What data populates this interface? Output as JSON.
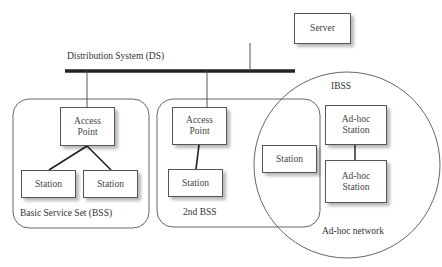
{
  "diagram": {
    "distribution_system": {
      "label": "Distribution System (DS)"
    },
    "server": {
      "label": "Server"
    },
    "bss1": {
      "label": "Basic Service Set (BSS)",
      "access_point": {
        "line1": "Access",
        "line2": "Point"
      },
      "stations": [
        {
          "label": "Station"
        },
        {
          "label": "Station"
        }
      ]
    },
    "bss2": {
      "label": "2nd BSS",
      "access_point": {
        "line1": "Access",
        "line2": "Point"
      },
      "station": {
        "label": "Station"
      }
    },
    "ibss": {
      "title": "IBSS",
      "label": "Ad-hoc network",
      "station": {
        "label": "Station"
      },
      "adhoc_stations": [
        {
          "line1": "Ad-hoc",
          "line2": "Station"
        },
        {
          "line1": "Ad-hoc",
          "line2": "Station"
        }
      ]
    }
  }
}
